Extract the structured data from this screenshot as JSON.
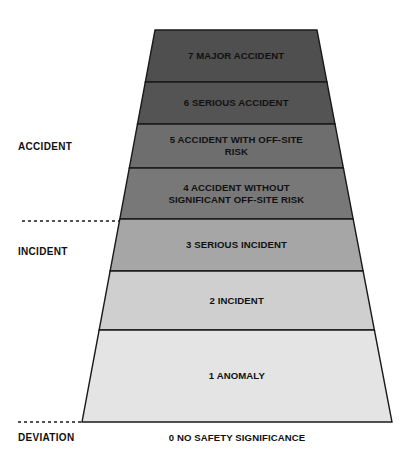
{
  "diagram": {
    "bands": [
      {
        "level": "7",
        "label": "7 MAJOR ACCIDENT",
        "lines": [
          "7 MAJOR ACCIDENT"
        ],
        "color": "#4f4f4f",
        "y_top": 30,
        "y_bottom": 82
      },
      {
        "level": "6",
        "label": "6 SERIOUS ACCIDENT",
        "lines": [
          "6 SERIOUS ACCIDENT"
        ],
        "color": "#545454",
        "y_top": 82,
        "y_bottom": 124
      },
      {
        "level": "5",
        "label": "5 ACCIDENT WITH OFF-SITE RISK",
        "lines": [
          "5 ACCIDENT WITH OFF-SITE",
          "RISK"
        ],
        "color": "#6e6e6e",
        "y_top": 124,
        "y_bottom": 168
      },
      {
        "level": "4",
        "label": "4 ACCIDENT WITHOUT SIGNIFICANT OFF-SITE RISK",
        "lines": [
          "4 ACCIDENT WITHOUT",
          "SIGNIFICANT OFF-SITE RISK"
        ],
        "color": "#787878",
        "y_top": 168,
        "y_bottom": 219
      },
      {
        "level": "3",
        "label": "3 SERIOUS INCIDENT",
        "lines": [
          "3 SERIOUS INCIDENT"
        ],
        "color": "#a6a6a6",
        "y_top": 219,
        "y_bottom": 271
      },
      {
        "level": "2",
        "label": "2 INCIDENT",
        "lines": [
          "2 INCIDENT"
        ],
        "color": "#cfcfcf",
        "y_top": 271,
        "y_bottom": 330
      },
      {
        "level": "1",
        "label": "1 ANOMALY",
        "lines": [
          "1 ANOMALY"
        ],
        "color": "#e4e4e4",
        "y_top": 330,
        "y_bottom": 422
      }
    ],
    "category_labels": [
      {
        "text": "ACCIDENT",
        "x": 18,
        "y": 147
      },
      {
        "text": "INCIDENT",
        "x": 18,
        "y": 252
      },
      {
        "text": "DEVIATION",
        "x": 18,
        "y": 438
      }
    ],
    "dashed_dividers": [
      {
        "x1": 22,
        "x2": 120,
        "y": 221
      },
      {
        "x1": 18,
        "x2": 82,
        "y": 422
      }
    ],
    "base_label": {
      "text": "0 NO SAFETY SIGNIFICANCE",
      "x": 237,
      "y": 438
    },
    "geometry": {
      "top_left_x": 155,
      "top_right_x": 317,
      "bottom_left_x": 82,
      "bottom_right_x": 392,
      "top_y": 30,
      "bottom_y": 422
    },
    "colors": {
      "outline": "#1a1a1a",
      "text": "#111111",
      "background": "#ffffff"
    }
  }
}
